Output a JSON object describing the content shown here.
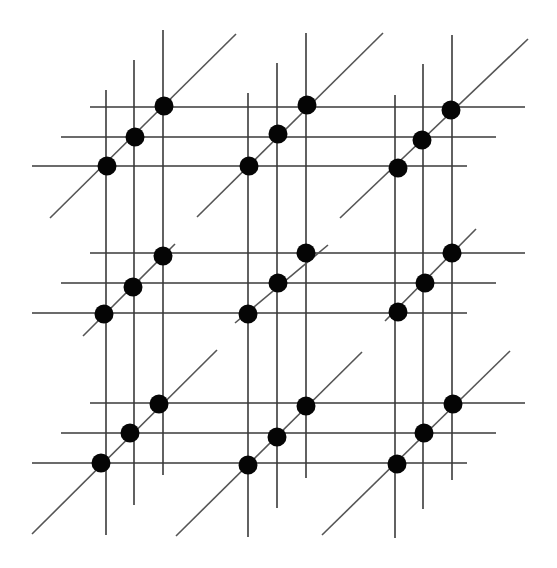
{
  "diagram": {
    "title": "",
    "colors": {
      "background": "#ffffff",
      "line": "#3a3a3a",
      "diagonal": "#555555",
      "node": "#050505"
    },
    "node_radius": 9.5,
    "vertical_lines": [
      {
        "x": 106,
        "y1": 90,
        "y2": 535
      },
      {
        "x": 134,
        "y1": 60,
        "y2": 505
      },
      {
        "x": 163,
        "y1": 30,
        "y2": 475
      },
      {
        "x": 248,
        "y1": 93,
        "y2": 537
      },
      {
        "x": 277,
        "y1": 63,
        "y2": 508
      },
      {
        "x": 306,
        "y1": 33,
        "y2": 478
      },
      {
        "x": 395,
        "y1": 95,
        "y2": 538
      },
      {
        "x": 423,
        "y1": 64,
        "y2": 509
      },
      {
        "x": 452,
        "y1": 35,
        "y2": 480
      }
    ],
    "horizontal_lines": [
      {
        "y": 107,
        "x1": 90,
        "x2": 525
      },
      {
        "y": 137,
        "x1": 61,
        "x2": 496
      },
      {
        "y": 166,
        "x1": 32,
        "x2": 467
      },
      {
        "y": 253,
        "x1": 90,
        "x2": 525
      },
      {
        "y": 283,
        "x1": 61,
        "x2": 496
      },
      {
        "y": 313,
        "x1": 32,
        "x2": 467
      },
      {
        "y": 403,
        "x1": 90,
        "x2": 525
      },
      {
        "y": 433,
        "x1": 61,
        "x2": 496
      },
      {
        "y": 463,
        "x1": 32,
        "x2": 467
      }
    ],
    "diagonal_lines": [
      {
        "x1": 50,
        "y1": 218,
        "x2": 236,
        "y2": 34
      },
      {
        "x1": 197,
        "y1": 217,
        "x2": 383,
        "y2": 33
      },
      {
        "x1": 340,
        "y1": 218,
        "x2": 528,
        "y2": 39
      },
      {
        "x1": 83,
        "y1": 336,
        "x2": 175,
        "y2": 244
      },
      {
        "x1": 235,
        "y1": 323,
        "x2": 328,
        "y2": 245
      },
      {
        "x1": 385,
        "y1": 321,
        "x2": 476,
        "y2": 229
      },
      {
        "x1": 32,
        "y1": 534,
        "x2": 217,
        "y2": 350
      },
      {
        "x1": 176,
        "y1": 536,
        "x2": 362,
        "y2": 352
      },
      {
        "x1": 322,
        "y1": 535,
        "x2": 510,
        "y2": 351
      }
    ],
    "nodes": [
      {
        "x": 107,
        "y": 166
      },
      {
        "x": 135,
        "y": 137
      },
      {
        "x": 164,
        "y": 106
      },
      {
        "x": 249,
        "y": 166
      },
      {
        "x": 278,
        "y": 134
      },
      {
        "x": 307,
        "y": 105
      },
      {
        "x": 398,
        "y": 168
      },
      {
        "x": 422,
        "y": 140
      },
      {
        "x": 451,
        "y": 110
      },
      {
        "x": 104,
        "y": 314
      },
      {
        "x": 133,
        "y": 287
      },
      {
        "x": 163,
        "y": 256
      },
      {
        "x": 248,
        "y": 314
      },
      {
        "x": 278,
        "y": 283
      },
      {
        "x": 306,
        "y": 253
      },
      {
        "x": 398,
        "y": 312
      },
      {
        "x": 425,
        "y": 283
      },
      {
        "x": 452,
        "y": 253
      },
      {
        "x": 101,
        "y": 463
      },
      {
        "x": 130,
        "y": 433
      },
      {
        "x": 159,
        "y": 404
      },
      {
        "x": 248,
        "y": 465
      },
      {
        "x": 277,
        "y": 437
      },
      {
        "x": 306,
        "y": 406
      },
      {
        "x": 397,
        "y": 464
      },
      {
        "x": 424,
        "y": 433
      },
      {
        "x": 453,
        "y": 404
      }
    ]
  }
}
